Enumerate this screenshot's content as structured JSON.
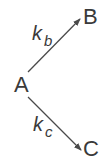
{
  "diagram": {
    "type": "reaction-scheme",
    "nodes": [
      {
        "id": "A",
        "label": "A"
      },
      {
        "id": "B",
        "label": "B"
      },
      {
        "id": "C",
        "label": "C"
      }
    ],
    "edges": [
      {
        "from": "A",
        "to": "B",
        "rate_symbol": "k",
        "rate_subscript": "b"
      },
      {
        "from": "A",
        "to": "C",
        "rate_symbol": "k",
        "rate_subscript": "c"
      }
    ]
  },
  "colors": {
    "text": "#3a3a3a",
    "arrow": "#4a4a4a",
    "background": "#ffffff"
  }
}
